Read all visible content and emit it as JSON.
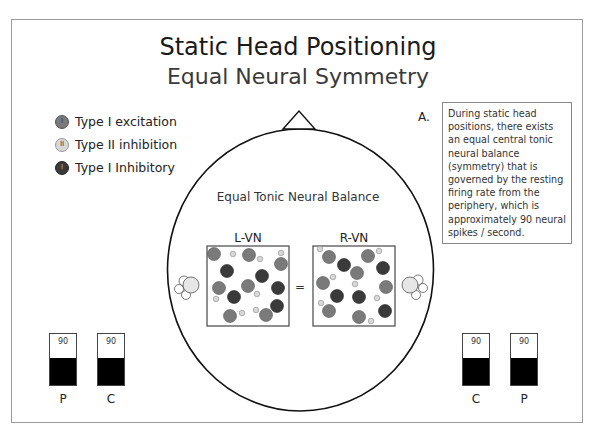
{
  "title": "Static Head Positioning",
  "subtitle": "Equal Neural Symmetry",
  "legend": [
    {
      "label": "Type I excitation",
      "glyph": "I",
      "color": "#7a7a7a"
    },
    {
      "label": "Type II inhibition",
      "glyph": "II",
      "color": "#d8d8d8"
    },
    {
      "label": "Type I Inhibitory",
      "glyph": "I",
      "color": "#3a3a3a"
    }
  ],
  "note": {
    "label": "A.",
    "text": "During static head positions, there exists an equal central tonic neural balance (symmetry) that is governed by the resting firing rate from the periphery, which is approximately 90 neural spikes / second."
  },
  "center_caption": "Equal Tonic Neural Balance",
  "nuclei": {
    "left_label": "L-VN",
    "right_label": "R-VN",
    "operator": "="
  },
  "meters": {
    "left": [
      {
        "label": "P",
        "value": "90"
      },
      {
        "label": "C",
        "value": "90"
      }
    ],
    "right": [
      {
        "label": "C",
        "value": "90"
      },
      {
        "label": "P",
        "value": "90"
      }
    ]
  },
  "colors": {
    "type1_excitation": "#7a7a7a",
    "type2_inhibition": "#d8d8d8",
    "type1_inhibitory": "#3a3a3a",
    "meter_fill": "#000000"
  }
}
